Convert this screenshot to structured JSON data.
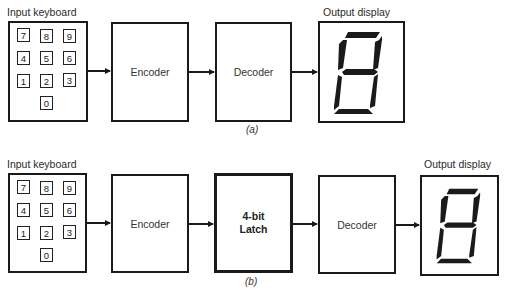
{
  "figure_a": {
    "caption": "(a)",
    "keyboard": {
      "label": "Input keyboard",
      "keys": [
        "7",
        "8",
        "9",
        "4",
        "5",
        "6",
        "1",
        "2",
        "3",
        "0"
      ]
    },
    "encoder": {
      "label": "Encoder"
    },
    "decoder": {
      "label": "Decoder"
    },
    "display": {
      "label": "Output display",
      "digit_segments": "all-seven-segments"
    }
  },
  "figure_b": {
    "caption": "(b)",
    "keyboard": {
      "label": "Input keyboard",
      "keys": [
        "7",
        "8",
        "9",
        "4",
        "5",
        "6",
        "1",
        "2",
        "3",
        "0"
      ]
    },
    "encoder": {
      "label": "Encoder"
    },
    "latch": {
      "line1": "4-bit",
      "line2": "Latch"
    },
    "decoder": {
      "label": "Decoder"
    },
    "display": {
      "label": "Output display",
      "digit_segments": "all-seven-segments"
    }
  }
}
